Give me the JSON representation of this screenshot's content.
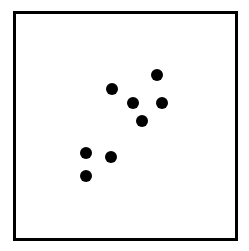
{
  "chart_data": {
    "type": "scatter",
    "title": "",
    "xlabel": "",
    "ylabel": "",
    "grid": false,
    "legend": null,
    "axes_ticks": false,
    "frame": {
      "left": 13,
      "top": 11,
      "width": 225,
      "height": 230
    },
    "point_color": "#000000",
    "point_radius": 6,
    "points_px": [
      {
        "x": 157,
        "y": 75
      },
      {
        "x": 112,
        "y": 89
      },
      {
        "x": 133,
        "y": 103
      },
      {
        "x": 162,
        "y": 103
      },
      {
        "x": 142,
        "y": 121
      },
      {
        "x": 86,
        "y": 153
      },
      {
        "x": 111,
        "y": 157
      },
      {
        "x": 86,
        "y": 176
      }
    ],
    "points_normalized": [
      {
        "x": 0.64,
        "y": 0.72
      },
      {
        "x": 0.44,
        "y": 0.66
      },
      {
        "x": 0.53,
        "y": 0.6
      },
      {
        "x": 0.66,
        "y": 0.6
      },
      {
        "x": 0.57,
        "y": 0.52
      },
      {
        "x": 0.32,
        "y": 0.38
      },
      {
        "x": 0.43,
        "y": 0.36
      },
      {
        "x": 0.32,
        "y": 0.28
      }
    ]
  }
}
